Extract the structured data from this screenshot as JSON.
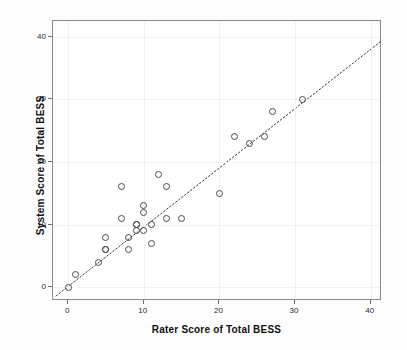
{
  "chart_data": {
    "type": "scatter",
    "title": "",
    "xlabel": "Rater Score of Total BESS",
    "ylabel": "System Score of Total BESS",
    "xlim": [
      -2,
      41.5
    ],
    "ylim": [
      -2.2,
      42.5
    ],
    "xticks": [
      0,
      10,
      20,
      30,
      40
    ],
    "yticks": [
      0,
      10,
      20,
      30,
      40
    ],
    "xtick_labels": [
      "0",
      "10",
      "20",
      "30",
      "40"
    ],
    "ytick_labels": [
      "0",
      "10",
      "20",
      "30",
      "40"
    ],
    "grid": true,
    "legend": "none",
    "marker": "open-circle",
    "marker_color": "#4a4a4a",
    "points": [
      {
        "x": 0,
        "y": 0
      },
      {
        "x": 1,
        "y": 2
      },
      {
        "x": 4,
        "y": 4
      },
      {
        "x": 5,
        "y": 6
      },
      {
        "x": 5,
        "y": 6
      },
      {
        "x": 5,
        "y": 8
      },
      {
        "x": 7,
        "y": 16
      },
      {
        "x": 7,
        "y": 11
      },
      {
        "x": 8,
        "y": 8
      },
      {
        "x": 8,
        "y": 6
      },
      {
        "x": 9,
        "y": 10
      },
      {
        "x": 9,
        "y": 10
      },
      {
        "x": 9,
        "y": 9
      },
      {
        "x": 10,
        "y": 13
      },
      {
        "x": 10,
        "y": 12
      },
      {
        "x": 10,
        "y": 9
      },
      {
        "x": 11,
        "y": 10
      },
      {
        "x": 11,
        "y": 7
      },
      {
        "x": 12,
        "y": 18
      },
      {
        "x": 13,
        "y": 16
      },
      {
        "x": 13,
        "y": 11
      },
      {
        "x": 15,
        "y": 11
      },
      {
        "x": 20,
        "y": 15
      },
      {
        "x": 22,
        "y": 24
      },
      {
        "x": 24,
        "y": 23
      },
      {
        "x": 26,
        "y": 24
      },
      {
        "x": 27,
        "y": 28
      },
      {
        "x": 31,
        "y": 30
      }
    ],
    "trend_line": {
      "style": "dotted",
      "color": "#3a3a3a",
      "x_start": -1.6,
      "y_start": -1.4,
      "x_end": 41.3,
      "y_end": 39.2
    }
  }
}
